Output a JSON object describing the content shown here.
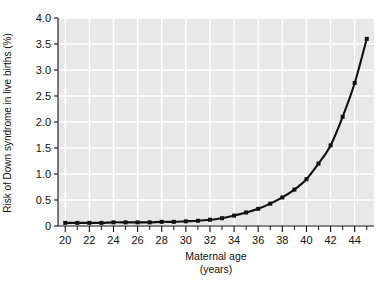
{
  "chart_data": {
    "type": "line",
    "title": "",
    "subtitle": "",
    "xlabel": "Maternal age",
    "xlabel_line2": "(years)",
    "ylabel": "Risk of Down syndrome in live births (%)",
    "xlim": [
      19.4,
      45.6
    ],
    "ylim": [
      0,
      4.0
    ],
    "grid": true,
    "grid_color": "#ffffff",
    "plot_background": "#e8e8e8",
    "legend": null,
    "legend_position": "none",
    "line_color": "#111111",
    "marker": "square",
    "xticks_major": [
      20,
      22,
      24,
      26,
      28,
      30,
      32,
      34,
      36,
      38,
      40,
      42,
      44
    ],
    "xtick_labels": [
      "20",
      "22",
      "24",
      "26",
      "28",
      "30",
      "32",
      "34",
      "36",
      "38",
      "40",
      "42",
      "44"
    ],
    "xticks_minor": [
      21,
      23,
      25,
      27,
      29,
      31,
      33,
      35,
      37,
      39,
      41,
      43,
      45
    ],
    "yticks": [
      0,
      0.5,
      1.0,
      1.5,
      2.0,
      2.5,
      3.0,
      3.5,
      4.0
    ],
    "ytick_labels": [
      "0",
      "0.5",
      "1.0",
      "1.5",
      "2.0",
      "2.5",
      "3.0",
      "3.5",
      "4.0"
    ],
    "x": [
      20,
      21,
      22,
      23,
      24,
      25,
      26,
      27,
      28,
      29,
      30,
      31,
      32,
      33,
      34,
      35,
      36,
      37,
      38,
      39,
      40,
      41,
      42,
      43,
      44,
      45
    ],
    "values": [
      0.06,
      0.06,
      0.06,
      0.06,
      0.07,
      0.07,
      0.07,
      0.07,
      0.08,
      0.08,
      0.09,
      0.1,
      0.12,
      0.15,
      0.2,
      0.26,
      0.33,
      0.43,
      0.55,
      0.7,
      0.9,
      1.2,
      1.55,
      2.1,
      2.75,
      3.6
    ],
    "series": [
      {
        "name": "Risk of Down syndrome",
        "values": [
          0.06,
          0.06,
          0.06,
          0.06,
          0.07,
          0.07,
          0.07,
          0.07,
          0.08,
          0.08,
          0.09,
          0.1,
          0.12,
          0.15,
          0.2,
          0.26,
          0.33,
          0.43,
          0.55,
          0.7,
          0.9,
          1.2,
          1.55,
          2.1,
          2.75,
          3.6
        ]
      }
    ]
  }
}
